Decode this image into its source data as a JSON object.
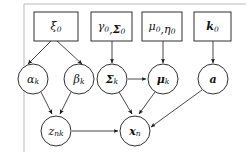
{
  "diagram": {
    "type": "directed-acyclic-graph",
    "background_color": "#ffffff",
    "stroke_color": "#1a1a1a",
    "frame_color": "#b9b9b9"
  },
  "hyperparameter_boxes": [
    {
      "id": "xi0",
      "name": "xi-zero-box",
      "parts": [
        {
          "base": "ξ",
          "sub": "0",
          "bold": false,
          "italic": true
        }
      ],
      "x": 34,
      "y": 12,
      "w": 44,
      "h": 29
    },
    {
      "id": "gamma0_Sigma0",
      "name": "gamma-zero-sigma-zero-box",
      "parts": [
        {
          "base": "γ",
          "sub": "0",
          "bold": false,
          "italic": true
        },
        {
          "base": ",",
          "sub": "",
          "bold": false,
          "italic": false
        },
        {
          "base": "Σ",
          "sub": "0",
          "bold": true,
          "italic": true
        }
      ],
      "x": 91,
      "y": 12,
      "w": 41,
      "h": 29
    },
    {
      "id": "mu0_eta0",
      "name": "mu-zero-eta-zero-box",
      "parts": [
        {
          "base": "μ",
          "sub": "0",
          "bold": false,
          "italic": true
        },
        {
          "base": ",",
          "sub": "",
          "bold": false,
          "italic": false
        },
        {
          "base": "η",
          "sub": "0",
          "bold": false,
          "italic": true
        }
      ],
      "x": 142,
      "y": 12,
      "w": 40,
      "h": 29
    },
    {
      "id": "k0",
      "name": "k-zero-box",
      "parts": [
        {
          "base": "k",
          "sub": "0",
          "bold": true,
          "italic": true
        }
      ],
      "x": 194,
      "y": 12,
      "w": 37,
      "h": 29
    }
  ],
  "latent_nodes": [
    {
      "id": "alpha_k",
      "name": "alpha-k-node",
      "parts": [
        {
          "base": "α",
          "sub": "k",
          "bold": false,
          "italic": true
        }
      ],
      "cx": 33,
      "cy": 79,
      "r": 15
    },
    {
      "id": "beta_k",
      "name": "beta-k-node",
      "parts": [
        {
          "base": "β",
          "sub": "k",
          "bold": false,
          "italic": true
        }
      ],
      "cx": 79,
      "cy": 79,
      "r": 15
    },
    {
      "id": "Sigma_k",
      "name": "sigma-k-node",
      "parts": [
        {
          "base": "Σ",
          "sub": "k",
          "bold": true,
          "italic": true
        }
      ],
      "cx": 112,
      "cy": 79,
      "r": 15
    },
    {
      "id": "mu_k",
      "name": "mu-k-node",
      "parts": [
        {
          "base": "μ",
          "sub": "k",
          "bold": true,
          "italic": true
        }
      ],
      "cx": 163,
      "cy": 79,
      "r": 15
    },
    {
      "id": "a",
      "name": "a-node",
      "parts": [
        {
          "base": "a",
          "sub": "",
          "bold": true,
          "italic": true
        }
      ],
      "cx": 213,
      "cy": 79,
      "r": 15
    }
  ],
  "observed_nodes": [
    {
      "id": "z_nk",
      "name": "z-nk-node",
      "parts": [
        {
          "base": "z",
          "sub": "nk",
          "bold": false,
          "italic": true
        }
      ],
      "cx": 56,
      "cy": 131,
      "r": 15
    },
    {
      "id": "x_n",
      "name": "x-n-node",
      "parts": [
        {
          "base": "x",
          "sub": "n",
          "bold": true,
          "italic": true
        }
      ],
      "cx": 135,
      "cy": 131,
      "r": 15
    }
  ],
  "edges": [
    {
      "name": "edge-xi0-to-alpha-k",
      "from": "xi0",
      "to": "alpha_k",
      "x1": 51,
      "y1": 41,
      "x2": 28,
      "y2": 64
    },
    {
      "name": "edge-xi0-to-beta-k",
      "from": "xi0",
      "to": "beta_k",
      "x1": 57,
      "y1": 41,
      "x2": 82,
      "y2": 64
    },
    {
      "name": "edge-gamma0-to-sigma-k",
      "from": "gamma0_Sigma0",
      "to": "Sigma_k",
      "x1": 112,
      "y1": 41,
      "x2": 112,
      "y2": 63
    },
    {
      "name": "edge-mu0-to-mu-k",
      "from": "mu0_eta0",
      "to": "mu_k",
      "x1": 163,
      "y1": 41,
      "x2": 163,
      "y2": 63
    },
    {
      "name": "edge-k0-to-a",
      "from": "k0",
      "to": "a",
      "x1": 213,
      "y1": 41,
      "x2": 213,
      "y2": 63
    },
    {
      "name": "edge-alpha-k-to-z-nk",
      "from": "alpha_k",
      "to": "z_nk",
      "x1": 41,
      "y1": 92,
      "x2": 52,
      "y2": 114
    },
    {
      "name": "edge-beta-k-to-z-nk",
      "from": "beta_k",
      "to": "z_nk",
      "x1": 71,
      "y1": 92,
      "x2": 60,
      "y2": 114
    },
    {
      "name": "edge-sigma-k-to-mu-k",
      "from": "Sigma_k",
      "to": "mu_k",
      "x1": 128,
      "y1": 79,
      "x2": 146,
      "y2": 79
    },
    {
      "name": "edge-sigma-k-to-x-n",
      "from": "Sigma_k",
      "to": "x_n",
      "x1": 119,
      "y1": 92,
      "x2": 132,
      "y2": 114
    },
    {
      "name": "edge-mu-k-to-x-n",
      "from": "mu_k",
      "to": "x_n",
      "x1": 155,
      "y1": 92,
      "x2": 139,
      "y2": 114
    },
    {
      "name": "edge-z-nk-to-x-n",
      "from": "z_nk",
      "to": "x_n",
      "x1": 72,
      "y1": 131,
      "x2": 118,
      "y2": 131
    },
    {
      "name": "edge-a-to-x-n",
      "from": "a",
      "to": "x_n",
      "x1": 202,
      "y1": 90,
      "x2": 151,
      "y2": 127
    }
  ],
  "frame": {
    "name": "image-frame",
    "left_x": 24,
    "top_y": 4,
    "bottom_y": 152,
    "top_x2": 246
  }
}
